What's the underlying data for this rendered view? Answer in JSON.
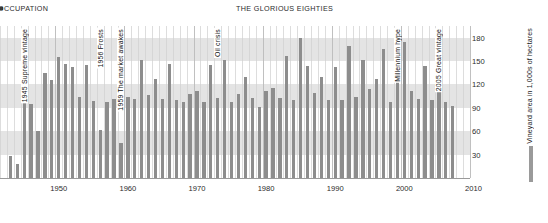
{
  "headers": {
    "left": "OCCUPATION",
    "center": "THE GLORIOUS EIGHTIES"
  },
  "legend": {
    "label": "Vineyard area in 1,000s of hectares",
    "color": "#9a9a9a"
  },
  "annotations": [
    {
      "year": 1945,
      "text": "1945 Supreme vintage"
    },
    {
      "year": 1956,
      "text": "1956 Frosts"
    },
    {
      "year": 1959,
      "text": "1959 The market awakes"
    },
    {
      "year": 1973,
      "text": "Oil crisis"
    },
    {
      "year": 1999,
      "text": "Millennium hype"
    },
    {
      "year": 2005,
      "text": "2005 Great vintage"
    }
  ],
  "chart_data": {
    "type": "bar",
    "title": "",
    "subtitle": "",
    "xlabel": "",
    "ylabel": "Vineyard area in 1,000s of hectares",
    "xlim": [
      1942,
      2010
    ],
    "ylim": [
      0,
      195
    ],
    "yticks": [
      30,
      60,
      90,
      120,
      150,
      180
    ],
    "xticks": [
      1950,
      1960,
      1970,
      1980,
      1990,
      2000,
      2010
    ],
    "grid": "horizontal-bands",
    "legend_position": "right",
    "bar_color": "#8d8d8d",
    "categories": [
      1943,
      1944,
      1945,
      1946,
      1947,
      1948,
      1949,
      1950,
      1951,
      1952,
      1953,
      1954,
      1955,
      1956,
      1957,
      1958,
      1959,
      1960,
      1961,
      1962,
      1963,
      1964,
      1965,
      1966,
      1967,
      1968,
      1969,
      1970,
      1971,
      1972,
      1973,
      1974,
      1975,
      1976,
      1977,
      1978,
      1979,
      1980,
      1981,
      1982,
      1983,
      1984,
      1985,
      1986,
      1987,
      1988,
      1989,
      1990,
      1991,
      1992,
      1993,
      1994,
      1995,
      1996,
      1997,
      1998,
      1999,
      2000,
      2001,
      2002,
      2003,
      2004,
      2005,
      2006,
      2007
    ],
    "values": [
      28,
      18,
      96,
      95,
      60,
      135,
      126,
      155,
      146,
      142,
      104,
      145,
      99,
      62,
      97,
      101,
      45,
      104,
      102,
      152,
      106,
      127,
      102,
      146,
      100,
      98,
      108,
      112,
      98,
      145,
      103,
      152,
      98,
      108,
      130,
      103,
      91,
      112,
      116,
      103,
      157,
      100,
      180,
      144,
      109,
      130,
      100,
      142,
      100,
      170,
      104,
      152,
      114,
      127,
      165,
      98,
      155,
      175,
      112,
      101,
      144,
      100,
      166,
      98,
      93
    ]
  }
}
